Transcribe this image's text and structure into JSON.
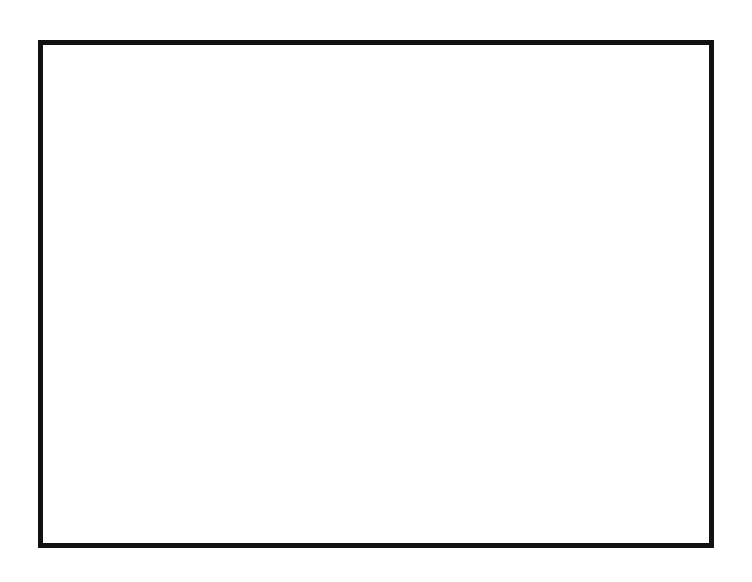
{
  "sheet": {
    "background_color": "#ffffff",
    "line_color": "#111111",
    "border": {
      "x": 38,
      "y": 40,
      "width": 676,
      "height": 508,
      "stroke_width": 5
    }
  },
  "drawing": {
    "name": "stepped-shaft-profile",
    "centerline_y": 269,
    "centerline_x_start": 163,
    "centerline_x_end": 655,
    "steps": [
      {
        "id": "step-1",
        "label": "2-1/4\"",
        "x1": 172,
        "x2": 244,
        "half_height": 145,
        "text_x": 208,
        "text_y": 190
      },
      {
        "id": "step-2",
        "label": "2.000",
        "x1": 244,
        "x2": 311,
        "half_height": 135,
        "text_x": 277,
        "text_y": 210
      },
      {
        "id": "step-3",
        "label": "1.000",
        "x1": 311,
        "x2": 375,
        "half_height": 61,
        "text_x": 343,
        "text_y": 243
      },
      {
        "id": "step-4",
        "label": "1-1/2\"",
        "x1": 375,
        "x2": 444,
        "half_height": 97,
        "text_x": 409,
        "text_y": 206
      },
      {
        "id": "step-5",
        "label": "1-1/4\"",
        "x1": 444,
        "x2": 512,
        "half_height": 81,
        "text_x": 478,
        "text_y": 237
      },
      {
        "id": "step-6",
        "label": ".750",
        "x1": 512,
        "x2": 578,
        "half_height": 50,
        "text_x": 545,
        "text_y": 248
      },
      {
        "id": "step-7",
        "label": ".500",
        "x1": 578,
        "x2": 641,
        "half_height": 33,
        "text_x": 644,
        "text_y": 213
      }
    ],
    "horizontal_dimension": {
      "label": "1.000",
      "x1": 172,
      "x2": 244,
      "y": 88,
      "text_x": 208,
      "text_y": 92
    }
  },
  "title_block": {
    "y": 498,
    "height": 50,
    "cells": [
      {
        "id": "name-cell",
        "label": "Your Name Here",
        "x": 42,
        "width": 212
      },
      {
        "id": "title-cell",
        "label": "Offset and Mirror Exercise",
        "x": 260,
        "width": 368
      },
      {
        "id": "drawing-number",
        "label": "Ex-12C",
        "x": 636,
        "width": 74
      }
    ]
  }
}
